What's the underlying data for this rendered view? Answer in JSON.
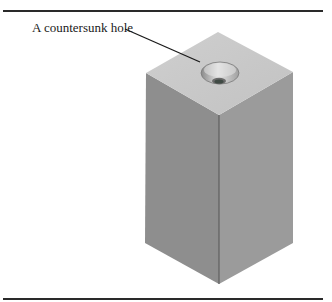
{
  "figure": {
    "annotation": {
      "label": "A countersunk hole",
      "target": "countersunk-hole"
    },
    "object": "rectangular block with countersunk hole on top face",
    "colors": {
      "top_face": "#c9c9c9",
      "left_face": "#8e8e8e",
      "right_face": "#9b9b9b",
      "edge": "#555555",
      "rule": "#2a2a2a",
      "leader": "#1a1a1a"
    }
  }
}
